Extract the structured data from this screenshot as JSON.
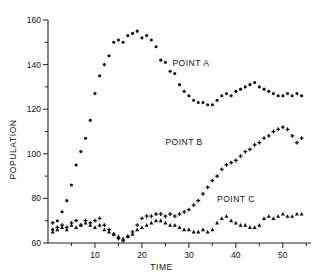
{
  "chart_data": {
    "type": "scatter",
    "title": "",
    "xlabel": "TIME",
    "ylabel": "POPULATION",
    "xlim": [
      0,
      56
    ],
    "ylim": [
      60,
      160
    ],
    "grid": false,
    "legend_position": "inline-annotations",
    "x_ticks_major": [
      10,
      20,
      30,
      40,
      50
    ],
    "x_ticks_minor": [
      5,
      15,
      25,
      35,
      45,
      55
    ],
    "y_ticks_major": [
      60,
      80,
      100,
      120,
      140,
      160
    ],
    "y_ticks_minor": [
      70,
      90,
      110,
      130,
      150
    ],
    "annotations": [
      {
        "text": "POINT A",
        "x": 26.5,
        "y": 139.5
      },
      {
        "text": "POINT B",
        "x": 25.0,
        "y": 104.0
      },
      {
        "text": "POINT C",
        "x": 36.0,
        "y": 78.5
      }
    ],
    "series": [
      {
        "name": "POINT A",
        "marker": "circle",
        "x": [
          1,
          2,
          3,
          4,
          5,
          6,
          7,
          8,
          9,
          10,
          11,
          12,
          13,
          14,
          15,
          16,
          17,
          18,
          19,
          20,
          21,
          22,
          23,
          24,
          25,
          26,
          27,
          28,
          29,
          30,
          31,
          32,
          33,
          34,
          35,
          36,
          37,
          38,
          39,
          40,
          41,
          42,
          43,
          44,
          45,
          46,
          47,
          48,
          49,
          50,
          51,
          52,
          53,
          54
        ],
        "y": [
          66,
          70,
          74,
          79,
          86,
          95,
          101,
          107,
          115,
          127,
          135,
          140,
          144,
          150,
          151,
          150,
          153,
          154,
          155,
          152,
          153,
          151,
          148,
          142,
          141,
          137,
          136,
          131,
          128,
          126,
          124,
          123,
          123,
          122,
          122,
          124,
          126,
          127,
          126,
          128,
          129,
          130,
          131,
          132,
          130,
          129,
          128,
          127,
          126,
          126,
          127,
          126,
          127,
          126
        ]
      },
      {
        "name": "POINT B",
        "marker": "plus",
        "x": [
          1,
          2,
          3,
          4,
          5,
          6,
          7,
          8,
          9,
          10,
          11,
          12,
          13,
          14,
          15,
          16,
          17,
          18,
          19,
          20,
          21,
          22,
          23,
          24,
          25,
          26,
          27,
          28,
          29,
          30,
          31,
          32,
          33,
          34,
          35,
          36,
          37,
          38,
          39,
          40,
          41,
          42,
          43,
          44,
          45,
          46,
          47,
          48,
          49,
          50,
          51,
          52,
          53,
          54
        ],
        "y": [
          69,
          67,
          68,
          67,
          69,
          70,
          68,
          70,
          69,
          70,
          71,
          68,
          66,
          64,
          62,
          61,
          63,
          65,
          68,
          71,
          72,
          72,
          73,
          73,
          72,
          73,
          72,
          73,
          74,
          75,
          77,
          79,
          82,
          85,
          88,
          90,
          93,
          95,
          96,
          97,
          99,
          101,
          102,
          104,
          105,
          107,
          108,
          110,
          111,
          112,
          111,
          108,
          105,
          107
        ]
      },
      {
        "name": "POINT C",
        "marker": "triangle",
        "x": [
          1,
          2,
          3,
          4,
          5,
          6,
          7,
          8,
          9,
          10,
          11,
          12,
          13,
          14,
          15,
          16,
          17,
          18,
          19,
          20,
          21,
          22,
          23,
          24,
          25,
          26,
          27,
          28,
          29,
          30,
          31,
          32,
          33,
          34,
          35,
          36,
          37,
          38,
          39,
          40,
          41,
          42,
          43,
          44,
          45,
          46,
          47,
          48,
          49,
          50,
          51,
          52,
          53,
          54
        ],
        "y": [
          65,
          66,
          67,
          66,
          68,
          67,
          68,
          69,
          68,
          67,
          68,
          66,
          65,
          64,
          63,
          62,
          63,
          64,
          66,
          67,
          68,
          69,
          70,
          70,
          69,
          68,
          68,
          67,
          66,
          66,
          65,
          65,
          66,
          65,
          66,
          69,
          71,
          72,
          70,
          69,
          68,
          68,
          67,
          67,
          68,
          71,
          72,
          71,
          72,
          73,
          72,
          72,
          73,
          73
        ]
      }
    ]
  }
}
